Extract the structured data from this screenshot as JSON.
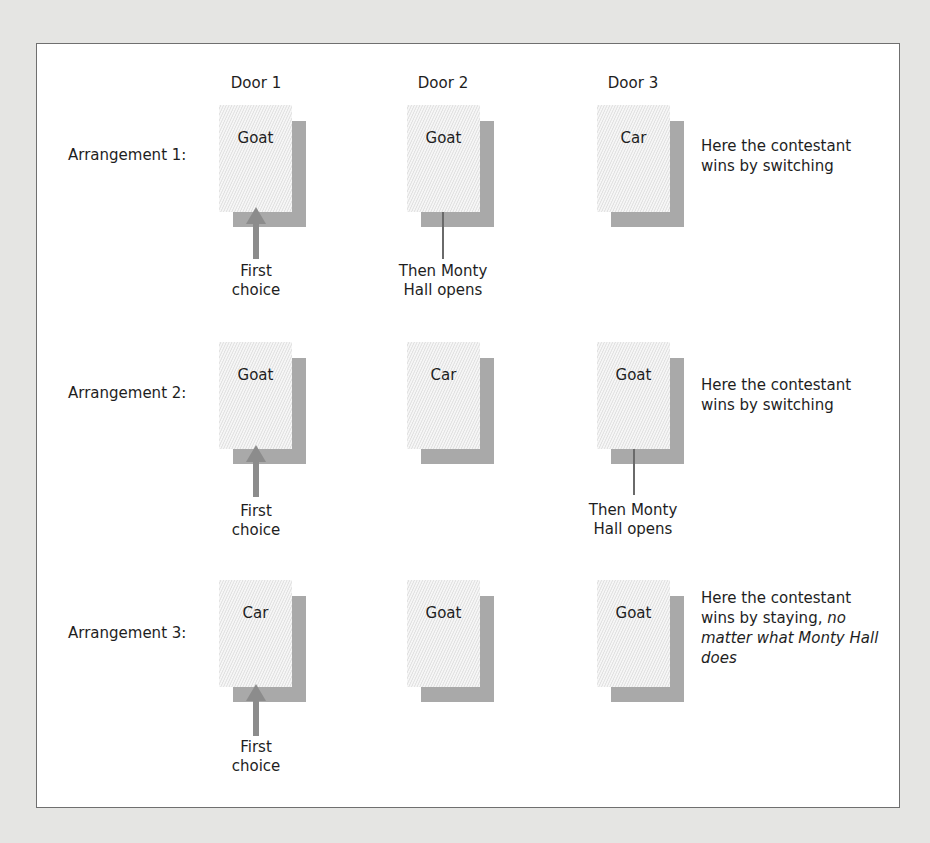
{
  "doors": [
    "Door 1",
    "Door 2",
    "Door 3"
  ],
  "arrangements": [
    {
      "label": "Arrangement 1:",
      "prizes": [
        "Goat",
        "Goat",
        "Car"
      ],
      "first_choice_door": 1,
      "opened_door": 2,
      "first_choice_caption": [
        "First",
        "choice"
      ],
      "opened_caption": [
        "Then Monty",
        "Hall opens"
      ],
      "note": {
        "plain": "Here the contestant wins by switching",
        "italic": ""
      }
    },
    {
      "label": "Arrangement 2:",
      "prizes": [
        "Goat",
        "Car",
        "Goat"
      ],
      "first_choice_door": 1,
      "opened_door": 3,
      "first_choice_caption": [
        "First",
        "choice"
      ],
      "opened_caption": [
        "Then Monty",
        "Hall opens"
      ],
      "note": {
        "plain": "Here the contestant wins by switching",
        "italic": ""
      }
    },
    {
      "label": "Arrangement 3:",
      "prizes": [
        "Car",
        "Goat",
        "Goat"
      ],
      "first_choice_door": 1,
      "opened_door": null,
      "first_choice_caption": [
        "First",
        "choice"
      ],
      "opened_caption": null,
      "note": {
        "plain": "Here the contestant wins by staying,",
        "italic": "no matter what Monty Hall does"
      }
    }
  ],
  "colors": {
    "background": "#e5e5e3",
    "frame": "#ffffff",
    "border": "#6f6f6f",
    "door_shadow": "#a9a9a9",
    "arrow": "#8c8c8c"
  }
}
